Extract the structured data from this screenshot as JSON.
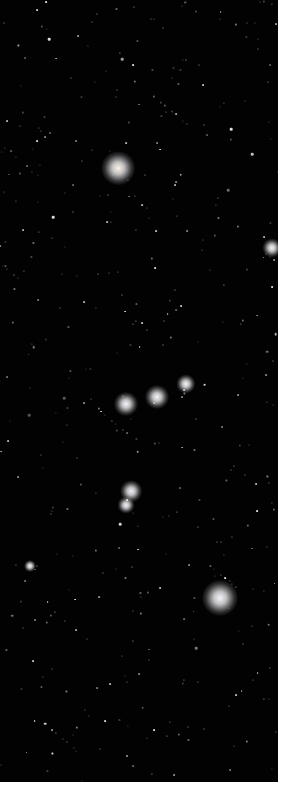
{
  "image": {
    "description": "Night sky star field showing the constellation Orion",
    "background_color": "#020202",
    "border_color": "#ffffff",
    "bright_stars": [
      {
        "name": "betelgeuse",
        "x": 118,
        "y": 168,
        "r": 14,
        "color": "#fff3e6"
      },
      {
        "name": "bellatrix",
        "x": 272,
        "y": 248,
        "r": 8,
        "color": "#f0f4ff"
      },
      {
        "name": "alnitak",
        "x": 126,
        "y": 404,
        "r": 10,
        "color": "#f4f6ff"
      },
      {
        "name": "alnilam",
        "x": 157,
        "y": 397,
        "r": 10,
        "color": "#f4f6ff"
      },
      {
        "name": "mintaka",
        "x": 186,
        "y": 384,
        "r": 8,
        "color": "#f4f6ff"
      },
      {
        "name": "orion-nebula-1",
        "x": 131,
        "y": 491,
        "r": 9,
        "color": "#eef0ff"
      },
      {
        "name": "orion-nebula-2",
        "x": 126,
        "y": 505,
        "r": 7,
        "color": "#eef0ff"
      },
      {
        "name": "saiph",
        "x": 30,
        "y": 566,
        "r": 5,
        "color": "#f4f6ff"
      },
      {
        "name": "rigel",
        "x": 220,
        "y": 598,
        "r": 15,
        "color": "#f4f6ff"
      }
    ]
  }
}
